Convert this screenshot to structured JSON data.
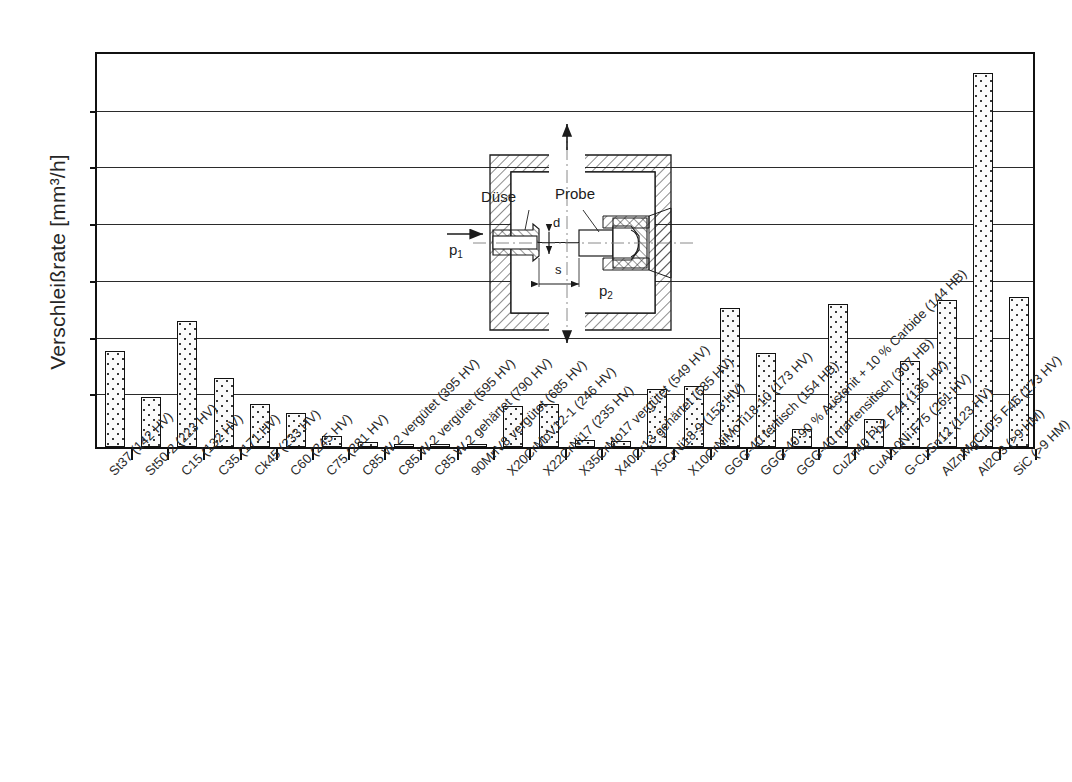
{
  "chart_data": {
    "type": "bar",
    "title": "",
    "xlabel": "",
    "ylabel": "Verschleißrate [mm³/h]",
    "ylim": [
      0,
      14
    ],
    "yticks": [
      0,
      2,
      4,
      6,
      8,
      10,
      12,
      14
    ],
    "grid": true,
    "legend": "none",
    "categories": [
      "St37 (142 HV)",
      "St50-2 (223 HV)",
      "C15 (132 HV)",
      "C35 (171 HV)",
      "Ck45 (233 HV)",
      "C60 (245 HV)",
      "C75 (281 HV)",
      "C85 W 2 vergütet (395 HV)",
      "C85 W 2 vergütet (595 HV)",
      "C85 W 2 gehärtet (790 HV)",
      "90MnV8 vergütet (685 HV)",
      "X20CrMoV12-1 (246 HV)",
      "X22CrNi17 (235 HV)",
      "X35CrMo17 vergütet (549 HV)",
      "X40Cr13 gehärtet (685 HV)",
      "X5CrNi18-9 (153 HV)",
      "X10CrNiMoTi18-10 (173 HV)",
      "GGG-40 feritisch (154 HB)",
      "GGG-40 90 % Austenit + 10 % Carbide (144 HB)",
      "GGG-40 martensitisch (307 HB)",
      "CuZn40 Pb2 F44 (136 HV)",
      "CuAl10Ni F75 (261 HV)",
      "G-CuSn12 (123 HV)",
      "AlZnMgCu0,5 F46 (173 HV)",
      "Al2O3 (>9 HM)",
      "SiC (>9 HM)"
    ],
    "values": [
      3.4,
      1.75,
      4.45,
      2.45,
      1.5,
      1.2,
      0.4,
      0.18,
      0.1,
      0.12,
      0.12,
      1.45,
      1.5,
      0.25,
      0.2,
      2.05,
      2.15,
      4.9,
      3.3,
      0.65,
      5.05,
      1.0,
      3.05,
      5.2,
      13.2,
      5.3
    ],
    "units": "mm³/h",
    "bar_style": {
      "fill": "#fbfbfb",
      "dot_color": "#3a3a3a",
      "edge": "#111111"
    }
  },
  "inset": {
    "name": "nozzle-specimen-cross-section",
    "labels": {
      "nozzle": "Düse",
      "specimen": "Probe",
      "gap": "d",
      "distance": "s",
      "pressure_in": "p",
      "pressure_in_sub": "1",
      "pressure_out": "p",
      "pressure_out_sub": "2"
    }
  },
  "axis": {
    "y_title": "Verschleißrate [mm³/h]"
  }
}
